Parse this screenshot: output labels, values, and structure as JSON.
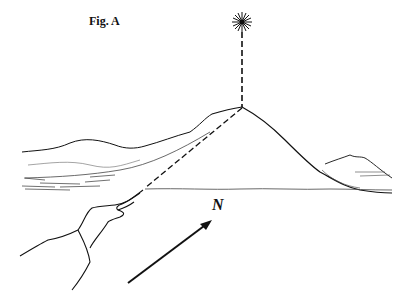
{
  "figure": {
    "title": "Fig. A",
    "direction_label": "N",
    "elements": [
      "star",
      "vertical-dashed-line",
      "mountain",
      "sight-line",
      "pointing-hand",
      "north-arrow",
      "distant-hills"
    ]
  }
}
